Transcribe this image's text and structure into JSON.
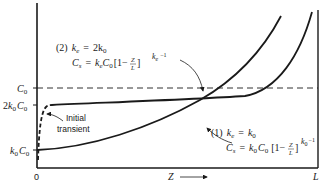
{
  "diagram": {
    "y_axis": {
      "labels": [
        {
          "id": "c0",
          "base": "C",
          "sub": "0"
        },
        {
          "id": "2k0c0",
          "prefix": "2",
          "base": "k",
          "sub": "0",
          "base2": "C",
          "sub2": "0"
        },
        {
          "id": "k0c0",
          "base": "k",
          "sub": "0",
          "base2": "C",
          "sub2": "0"
        }
      ]
    },
    "x_axis": {
      "origin_label": "0",
      "variable_label": "Z",
      "arrow": "→",
      "end_label": "L"
    },
    "reference_line": {
      "name": "C0",
      "style": "dashed"
    },
    "curves": [
      {
        "id": "curve-1",
        "number": "(1)",
        "condition_lhs": "k",
        "condition_lhs_sub": "e",
        "condition_rhs": "k",
        "condition_rhs_sub": "0",
        "formula_lhs": "C",
        "formula_lhs_sub": "s",
        "formula_coef": "k",
        "formula_coef_sub": "0",
        "formula_c": "C",
        "formula_c_sub": "0",
        "formula_bracket": "[1−",
        "frac_num": "Z",
        "frac_den": "L",
        "bracket_close": "]",
        "exponent_base": "k",
        "exponent_sub": "0",
        "exponent_tail": "−1"
      },
      {
        "id": "curve-2",
        "number": "(2)",
        "condition_lhs": "k",
        "condition_lhs_sub": "e",
        "condition_rhs": "2k",
        "condition_rhs_sub": "0",
        "formula_lhs": "C",
        "formula_lhs_sub": "s",
        "formula_coef": "k",
        "formula_coef_sub": "e",
        "formula_c": "C",
        "formula_c_sub": "0",
        "formula_bracket": "[1−",
        "frac_num": "Z",
        "frac_den": "L",
        "bracket_close": "]",
        "exponent_base": "k",
        "exponent_sub": "e",
        "exponent_tail": "−1"
      }
    ],
    "annotation": {
      "line1": "Initial",
      "line2": "transient"
    },
    "equals": "="
  }
}
